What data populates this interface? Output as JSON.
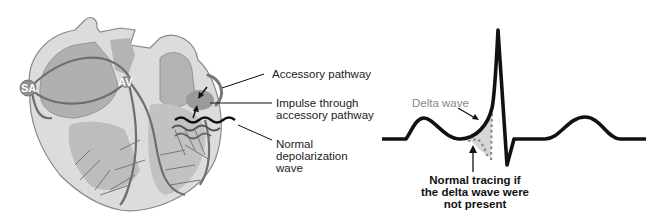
{
  "figure": {
    "left_panel": {
      "title": "Heart conduction system with accessory pathway",
      "nodes": {
        "sa": "SA",
        "av": "AV"
      },
      "labels": {
        "accessory_pathway": "Accessory pathway",
        "impulse_line1": "Impulse through",
        "impulse_line2": "accessory pathway",
        "normal_line1": "Normal",
        "normal_line2": "depolarization",
        "normal_line3": "wave"
      }
    },
    "right_panel": {
      "title": "ECG tracing showing delta wave",
      "labels": {
        "delta_wave": "Delta wave",
        "normal_line1": "Normal tracing if",
        "normal_line2": "the delta wave were",
        "normal_line3": "not present"
      }
    },
    "colors": {
      "heart_outer": "#d9d9d9",
      "heart_chamber": "#a8a8a8",
      "conduction": "#6e6e6e",
      "trace": "#111111",
      "dotted": "#8a8a8a",
      "shade": "#d4d4d4"
    }
  }
}
